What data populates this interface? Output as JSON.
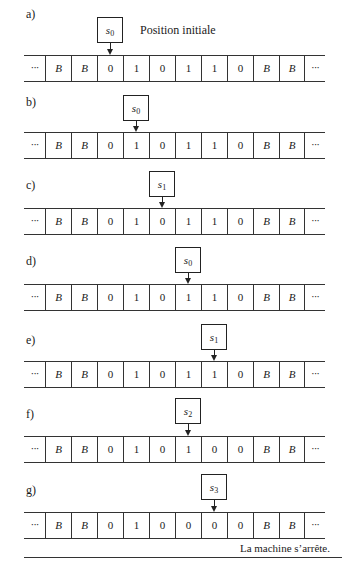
{
  "figure": {
    "initial_position_note": "Position initiale",
    "halt_note": "La machine s’arrête.",
    "ellipsis": "···",
    "tape_cell_count": 10,
    "steps": [
      {
        "label": "a)",
        "state": "s",
        "state_index": "0",
        "head_cell": 2,
        "cells": [
          "B",
          "B",
          "0",
          "1",
          "0",
          "1",
          "1",
          "0",
          "B",
          "B"
        ]
      },
      {
        "label": "b)",
        "state": "s",
        "state_index": "0",
        "head_cell": 3,
        "cells": [
          "B",
          "B",
          "0",
          "1",
          "0",
          "1",
          "1",
          "0",
          "B",
          "B"
        ]
      },
      {
        "label": "c)",
        "state": "s",
        "state_index": "1",
        "head_cell": 4,
        "cells": [
          "B",
          "B",
          "0",
          "1",
          "0",
          "1",
          "1",
          "0",
          "B",
          "B"
        ]
      },
      {
        "label": "d)",
        "state": "s",
        "state_index": "0",
        "head_cell": 5,
        "cells": [
          "B",
          "B",
          "0",
          "1",
          "0",
          "1",
          "1",
          "0",
          "B",
          "B"
        ]
      },
      {
        "label": "e)",
        "state": "s",
        "state_index": "1",
        "head_cell": 6,
        "cells": [
          "B",
          "B",
          "0",
          "1",
          "0",
          "1",
          "1",
          "0",
          "B",
          "B"
        ]
      },
      {
        "label": "f)",
        "state": "s",
        "state_index": "2",
        "head_cell": 5,
        "cells": [
          "B",
          "B",
          "0",
          "1",
          "0",
          "1",
          "0",
          "0",
          "B",
          "B"
        ]
      },
      {
        "label": "g)",
        "state": "s",
        "state_index": "3",
        "head_cell": 6,
        "cells": [
          "B",
          "B",
          "0",
          "1",
          "0",
          "0",
          "0",
          "0",
          "B",
          "B"
        ]
      }
    ]
  }
}
